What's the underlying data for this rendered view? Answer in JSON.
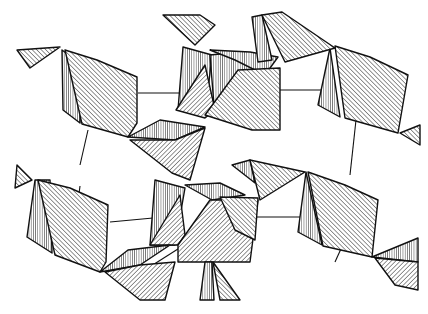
{
  "figure": {
    "type": "crystal-structure-polyhedra",
    "width": 428,
    "height": 314,
    "background": "#ffffff",
    "ink": "#111111",
    "text": []
  },
  "hatches": [
    {
      "id": "h1",
      "angle": 45,
      "gap": 3.2
    },
    {
      "id": "h2",
      "angle": -45,
      "gap": 3.2
    },
    {
      "id": "h3",
      "angle": 0,
      "gap": 2.2
    },
    {
      "id": "h4",
      "angle": 60,
      "gap": 2.6
    },
    {
      "id": "h5",
      "angle": -30,
      "gap": 2.4
    }
  ],
  "links": [
    [
      138,
      93,
      185,
      93
    ],
    [
      258,
      90,
      330,
      90
    ],
    [
      88,
      130,
      80,
      165
    ],
    [
      356,
      120,
      350,
      175
    ],
    [
      80,
      186,
      75,
      225
    ],
    [
      255,
      217,
      310,
      217
    ],
    [
      110,
      222,
      153,
      218
    ],
    [
      345,
      240,
      335,
      262
    ],
    [
      148,
      268,
      200,
      235
    ]
  ],
  "polyhedra": [
    {
      "name": "octa-top-left",
      "faces": [
        {
          "pts": [
            [
              17,
              50
            ],
            [
              60,
              47
            ],
            [
              30,
              68
            ]
          ],
          "h": "h2"
        },
        {
          "pts": [
            [
              62,
              50
            ],
            [
              63,
              110
            ],
            [
              80,
              123
            ],
            [
              82,
              65
            ]
          ],
          "h": "h3"
        },
        {
          "pts": [
            [
              65,
              50
            ],
            [
              97,
              60
            ],
            [
              137,
              77
            ],
            [
              137,
              123
            ],
            [
              128,
              137
            ],
            [
              82,
              124
            ]
          ],
          "h": "h2"
        }
      ]
    },
    {
      "name": "octa-top-right",
      "faces": [
        {
          "pts": [
            [
              330,
              48
            ],
            [
              318,
              105
            ],
            [
              340,
              117
            ]
          ],
          "h": "h3"
        },
        {
          "pts": [
            [
              335,
              46
            ],
            [
              345,
              118
            ],
            [
              398,
              133
            ],
            [
              408,
              75
            ],
            [
              370,
              57
            ]
          ],
          "h": "h2"
        },
        {
          "pts": [
            [
              400,
              133
            ],
            [
              420,
              125
            ],
            [
              420,
              145
            ]
          ],
          "h": "h2"
        }
      ]
    },
    {
      "name": "octa-center-top",
      "faces": [
        {
          "pts": [
            [
              163,
              15
            ],
            [
              200,
              15
            ],
            [
              215,
              25
            ],
            [
              195,
              45
            ]
          ],
          "h": "h2"
        },
        {
          "pts": [
            [
              183,
              47
            ],
            [
              178,
              110
            ],
            [
              206,
              108
            ],
            [
              212,
              55
            ]
          ],
          "h": "h3"
        },
        {
          "pts": [
            [
              176,
              110
            ],
            [
              205,
              65
            ],
            [
              215,
              110
            ],
            [
              205,
              118
            ]
          ],
          "h": "h1"
        },
        {
          "pts": [
            [
              210,
              55
            ],
            [
              240,
              52
            ],
            [
              255,
              70
            ],
            [
              215,
              118
            ]
          ],
          "h": "h3"
        },
        {
          "pts": [
            [
              210,
              50
            ],
            [
              250,
              52
            ],
            [
              278,
              57
            ],
            [
              265,
              75
            ],
            [
              235,
              60
            ]
          ],
          "h": "h3"
        },
        {
          "pts": [
            [
              205,
              115
            ],
            [
              238,
              70
            ],
            [
              280,
              68
            ],
            [
              280,
              130
            ],
            [
              252,
              130
            ]
          ],
          "h": "h2"
        },
        {
          "pts": [
            [
              252,
              17
            ],
            [
              262,
              15
            ],
            [
              272,
              60
            ],
            [
              258,
              62
            ]
          ],
          "h": "h3"
        },
        {
          "pts": [
            [
              262,
              15
            ],
            [
              282,
              12
            ],
            [
              335,
              48
            ],
            [
              285,
              62
            ]
          ],
          "h": "h2"
        }
      ]
    },
    {
      "name": "bridge-left-mid",
      "faces": [
        {
          "pts": [
            [
              128,
              137
            ],
            [
              160,
              120
            ],
            [
              205,
              127
            ],
            [
              175,
              140
            ]
          ],
          "h": "h3"
        },
        {
          "pts": [
            [
              130,
              140
            ],
            [
              175,
              140
            ],
            [
              205,
              128
            ],
            [
              190,
              180
            ],
            [
              172,
              173
            ]
          ],
          "h": "h1"
        }
      ]
    },
    {
      "name": "octa-mid-left",
      "faces": [
        {
          "pts": [
            [
              17,
              165
            ],
            [
              32,
              180
            ],
            [
              15,
              188
            ]
          ],
          "h": "h2"
        },
        {
          "pts": [
            [
              35,
              180
            ],
            [
              27,
              237
            ],
            [
              52,
              253
            ],
            [
              50,
              180
            ]
          ],
          "h": "h3"
        },
        {
          "pts": [
            [
              38,
              180
            ],
            [
              70,
              188
            ],
            [
              108,
              205
            ],
            [
              106,
              262
            ],
            [
              100,
              272
            ],
            [
              55,
              255
            ]
          ],
          "h": "h2"
        }
      ]
    },
    {
      "name": "octa-mid-right",
      "faces": [
        {
          "pts": [
            [
              306,
              172
            ],
            [
              298,
              232
            ],
            [
              322,
              245
            ]
          ],
          "h": "h3"
        },
        {
          "pts": [
            [
              308,
              172
            ],
            [
              345,
              185
            ],
            [
              378,
              200
            ],
            [
              372,
              257
            ],
            [
              323,
              246
            ]
          ],
          "h": "h2"
        }
      ]
    },
    {
      "name": "octa-center-bottom",
      "faces": [
        {
          "pts": [
            [
              155,
              180
            ],
            [
              150,
              245
            ],
            [
              175,
              245
            ],
            [
              185,
              188
            ]
          ],
          "h": "h3"
        },
        {
          "pts": [
            [
              150,
              245
            ],
            [
              180,
              195
            ],
            [
              185,
              235
            ],
            [
              178,
              245
            ]
          ],
          "h": "h1"
        },
        {
          "pts": [
            [
              185,
              185
            ],
            [
              220,
              183
            ],
            [
              245,
              195
            ],
            [
              212,
              200
            ]
          ],
          "h": "h3"
        },
        {
          "pts": [
            [
              178,
              245
            ],
            [
              210,
              200
            ],
            [
              258,
              200
            ],
            [
              250,
              262
            ],
            [
              178,
              262
            ]
          ],
          "h": "h1"
        },
        {
          "pts": [
            [
              220,
              197
            ],
            [
              258,
              198
            ],
            [
              255,
              240
            ],
            [
              235,
              230
            ]
          ],
          "h": "h2"
        },
        {
          "pts": [
            [
              232,
              165
            ],
            [
              250,
              160
            ],
            [
              255,
              183
            ]
          ],
          "h": "h3"
        },
        {
          "pts": [
            [
              250,
              160
            ],
            [
              305,
              172
            ],
            [
              260,
              200
            ]
          ],
          "h": "h2"
        }
      ]
    },
    {
      "name": "bridge-left-bottom",
      "faces": [
        {
          "pts": [
            [
              100,
              272
            ],
            [
              128,
              250
            ],
            [
              170,
              245
            ],
            [
              140,
              265
            ]
          ],
          "h": "h3"
        },
        {
          "pts": [
            [
              105,
              272
            ],
            [
              140,
              265
            ],
            [
              175,
              262
            ],
            [
              165,
              300
            ],
            [
              140,
              300
            ]
          ],
          "h": "h1"
        }
      ]
    },
    {
      "name": "bottom-fragments",
      "faces": [
        {
          "pts": [
            [
              205,
              262
            ],
            [
              212,
              262
            ],
            [
              214,
              300
            ],
            [
              200,
              300
            ]
          ],
          "h": "h3"
        },
        {
          "pts": [
            [
              213,
              262
            ],
            [
              240,
              300
            ],
            [
              220,
              300
            ]
          ],
          "h": "h2"
        },
        {
          "pts": [
            [
              372,
              257
            ],
            [
              418,
              238
            ],
            [
              418,
              262
            ]
          ],
          "h": "h3"
        },
        {
          "pts": [
            [
              375,
              258
            ],
            [
              418,
              262
            ],
            [
              418,
              290
            ],
            [
              395,
              285
            ]
          ],
          "h": "h1"
        }
      ]
    }
  ]
}
